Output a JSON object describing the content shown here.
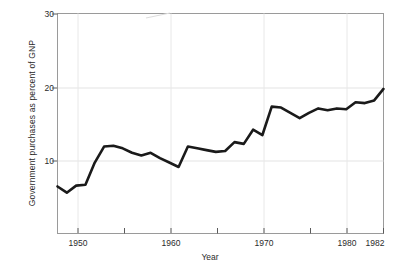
{
  "chart_data": {
    "type": "line",
    "title": "",
    "xlabel": "Year",
    "ylabel": "Government purchases as percent of GNP",
    "xlim": [
      1947,
      1982
    ],
    "ylim": [
      5.2,
      30
    ],
    "grid": true,
    "legend": "none",
    "x_ticks": [
      1950,
      1955,
      1960,
      1965,
      1970,
      1975,
      1980,
      1982
    ],
    "x_tick_labels": [
      "1950",
      "1960",
      "1970",
      "1980",
      "1982"
    ],
    "x_tick_label_values": [
      1950,
      1960,
      1970,
      1980,
      1982
    ],
    "y_ticks": [
      10,
      20,
      30
    ],
    "y_tick_labels": [
      "10",
      "20",
      "30"
    ],
    "series": [
      {
        "name": "Government purchases as percent of GNP",
        "color": "#1a1a1a",
        "x": [
          1947,
          1948,
          1949,
          1950,
          1951,
          1952,
          1953,
          1954,
          1955,
          1956,
          1957,
          1958,
          1959,
          1960,
          1961,
          1962,
          1963,
          1964,
          1965,
          1966,
          1967,
          1968,
          1969,
          1970,
          1971,
          1972,
          1973,
          1974,
          1975,
          1976,
          1977,
          1978,
          1979,
          1980,
          1981,
          1982
        ],
        "values": [
          10.5,
          9.8,
          10.6,
          10.7,
          13.2,
          15.0,
          15.1,
          14.8,
          14.3,
          14.0,
          14.3,
          13.7,
          13.2,
          12.7,
          15.0,
          14.8,
          14.6,
          14.4,
          14.5,
          15.5,
          15.3,
          16.9,
          16.3,
          19.5,
          19.4,
          18.8,
          18.2,
          18.8,
          19.3,
          19.1,
          19.3,
          19.2,
          20.0,
          19.9,
          20.2,
          21.5
        ]
      }
    ]
  },
  "axes": {
    "y_axis_label": "Government purchases as percent of GNP",
    "x_axis_label": "Year"
  }
}
